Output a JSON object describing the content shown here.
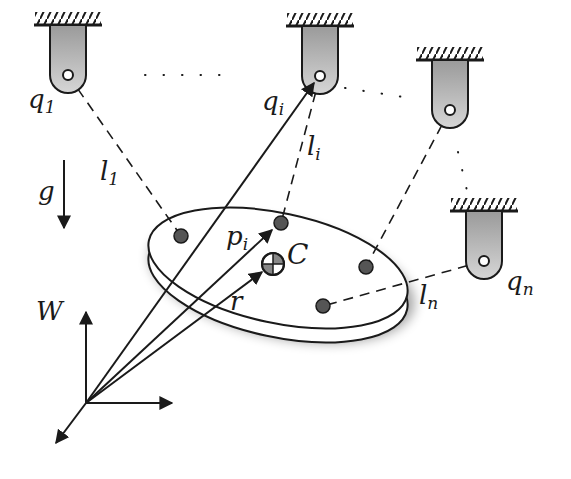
{
  "diagram": {
    "labels": {
      "q1": {
        "base": "q",
        "sub": "1"
      },
      "qi": {
        "base": "q",
        "sub": "i"
      },
      "qn": {
        "base": "q",
        "sub": "n"
      },
      "l1": {
        "base": "l",
        "sub": "1"
      },
      "li": {
        "base": "l",
        "sub": "i"
      },
      "ln": {
        "base": "l",
        "sub": "n"
      },
      "pi": {
        "base": "p",
        "sub": "i"
      },
      "C": "C",
      "r": "r",
      "g": "g",
      "W": "W"
    },
    "anchors": [
      {
        "id": "q1",
        "x": 68,
        "y": 75
      },
      {
        "id": "qi",
        "x": 320,
        "y": 76
      },
      {
        "id": "q3",
        "x": 450,
        "y": 110
      },
      {
        "id": "qn",
        "x": 484,
        "y": 261
      }
    ],
    "platform_points": [
      {
        "id": "b1",
        "x": 181,
        "y": 236
      },
      {
        "id": "bi",
        "x": 281,
        "y": 223
      },
      {
        "id": "b3",
        "x": 366,
        "y": 267
      },
      {
        "id": "bn",
        "x": 323,
        "y": 306
      }
    ],
    "center": {
      "x": 273,
      "y": 264
    },
    "world_origin": {
      "x": 86,
      "y": 403
    },
    "colors": {
      "stroke": "#1a1a1a",
      "anchor_fill": "#bdbdbd",
      "point_fill": "#555555",
      "platform_fill": "#ffffff"
    }
  }
}
